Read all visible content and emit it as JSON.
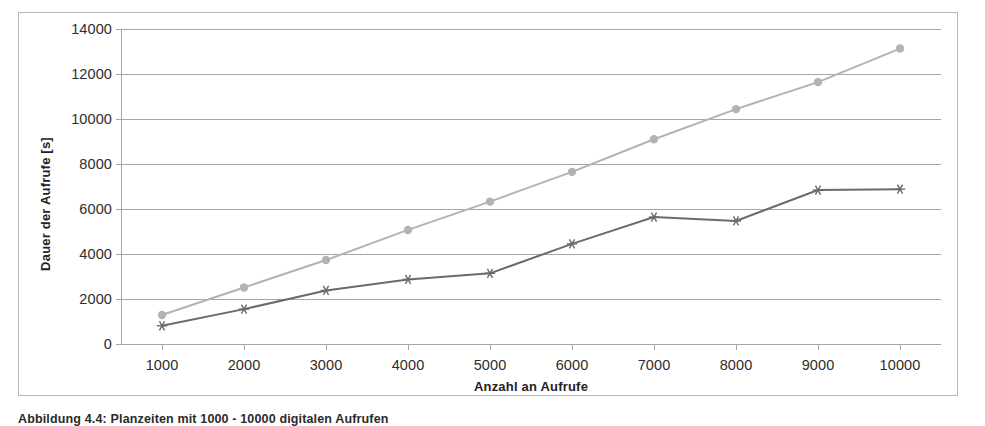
{
  "chart_data": {
    "type": "line",
    "title": "",
    "xlabel": "Anzahl an Aufrufe",
    "ylabel": "Dauer der Aufrufe [s]",
    "x": [
      1000,
      2000,
      3000,
      4000,
      5000,
      6000,
      7000,
      8000,
      9000,
      10000
    ],
    "xticklabels": [
      "1000",
      "2000",
      "3000",
      "4000",
      "5000",
      "6000",
      "7000",
      "8000",
      "9000",
      "10000"
    ],
    "yticks": [
      0,
      2000,
      4000,
      6000,
      8000,
      10000,
      12000,
      14000
    ],
    "yticklabels": [
      "0",
      "2000",
      "4000",
      "6000",
      "8000",
      "10000",
      "12000",
      "14000"
    ],
    "xlim": [
      500,
      10500
    ],
    "ylim": [
      0,
      14000
    ],
    "grid": "horizontal",
    "legend": "none",
    "series": [
      {
        "name": "series-light",
        "color": "#b3b3b3",
        "marker": "circle",
        "values": [
          1290,
          2510,
          3730,
          5070,
          6330,
          7650,
          9100,
          10440,
          11640,
          13130
        ]
      },
      {
        "name": "series-dark",
        "color": "#6b6b6b",
        "marker": "asterisk",
        "values": [
          810,
          1550,
          2380,
          2870,
          3140,
          4450,
          5640,
          5470,
          6840,
          6880
        ]
      }
    ]
  },
  "figure": {
    "caption": "Abbildung 4.4: Planzeiten mit 1000 - 10000 digitalen Aufrufen",
    "border_color": "#b9b9b9",
    "gridline_color": "#a6a6a6"
  }
}
